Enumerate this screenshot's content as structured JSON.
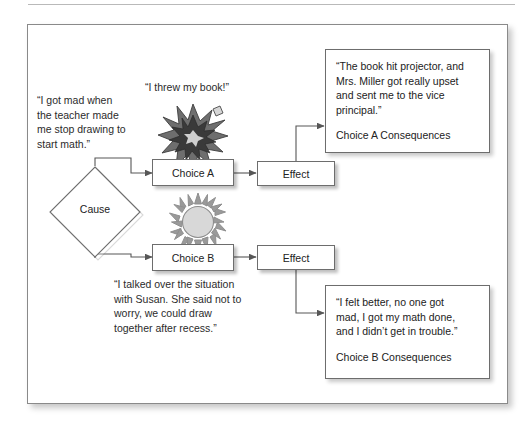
{
  "diagram": {
    "colors": {
      "frame_border": "#8a8a8a",
      "box_border": "#6d6d6d",
      "box_fill": "#ffffff",
      "connector": "#575757",
      "sun_fill": "#d8d8d8",
      "sun_spike": "#8f8f8f",
      "explosion_outer": "#6e6e6e",
      "explosion_inner": "#3a3a3a",
      "text": "#222222"
    },
    "cause": {
      "label": "Cause",
      "annotation": "“I got mad when\nthe  teacher made\nme stop drawing to\nstart math.”"
    },
    "branch_a": {
      "annotation": "“I threw my book!”",
      "icon": "explosion-star-icon",
      "choice_label": "Choice A",
      "effect_label": "Effect",
      "consequence_quote": "“The book hit projector, and\nMrs. Miller got really upset\nand sent me to the vice\nprincipal.”",
      "consequence_label": "Choice A Consequences"
    },
    "branch_b": {
      "annotation": "“I talked over the situation\nwith Susan. She said not to\nworry, we could draw\ntogether after recess.”",
      "icon": "sun-burst-icon",
      "choice_label": "Choice B",
      "effect_label": "Effect",
      "consequence_quote": "“I felt better, no one got\nmad, I got my math done,\nand I didn’t get in trouble.”",
      "consequence_label": "Choice B Consequences"
    }
  }
}
